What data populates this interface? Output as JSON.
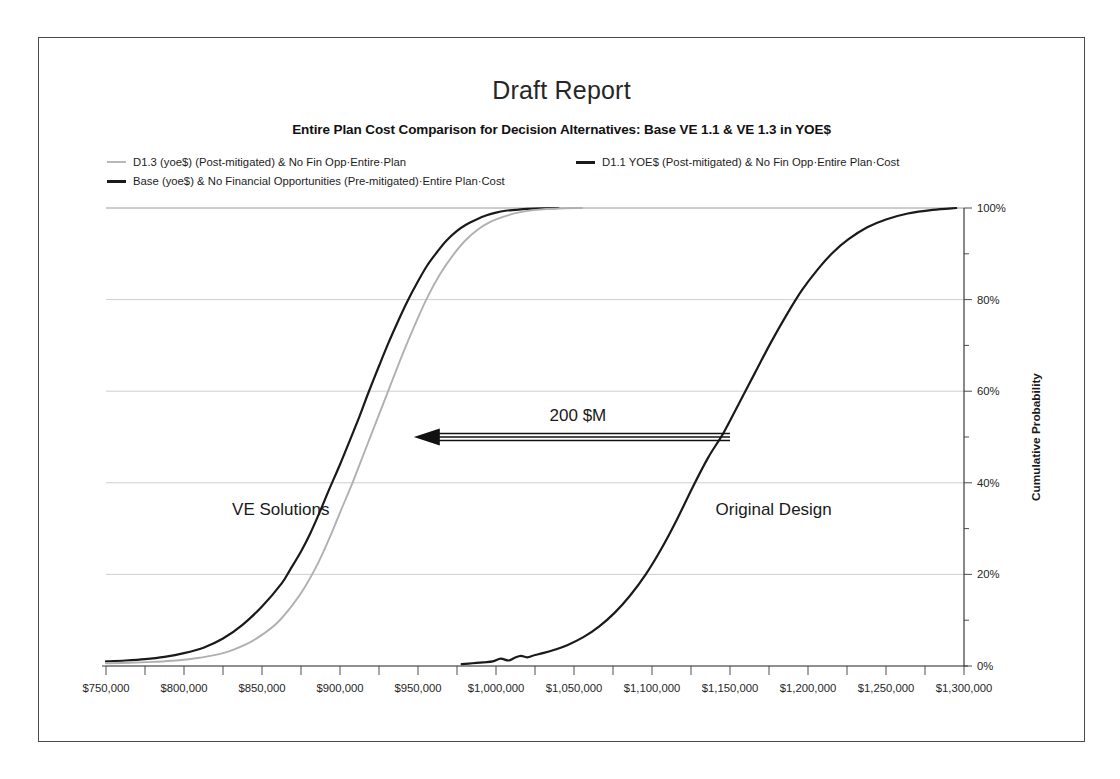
{
  "title": "Draft Report",
  "subtitle": "Entire Plan Cost Comparison for Decision Alternatives: Base VE 1.1 & VE 1.3 in YOE$",
  "legend": [
    {
      "label": "D1.3 (yoe$) (Post-mitigated) & No Fin Opp·Entire·Plan",
      "color": "#b8b8b8"
    },
    {
      "label": "Base (yoe$) & No Financial Opportunities (Pre-mitigated)·Entire Plan·Cost",
      "color": "#1a1a1a"
    },
    {
      "label": "D1.1 YOE$ (Post-mitigated) & No Fin Opp·Entire Plan·Cost",
      "color": "#1a1a1a"
    }
  ],
  "annotations": {
    "delta_label": "200 $M",
    "left_zone": "VE Solutions",
    "right_zone": "Original Design"
  },
  "chart_data": {
    "type": "line",
    "title": "Entire Plan Cost Comparison for Decision Alternatives: Base VE 1.1 & VE 1.3 in YOE$",
    "subtitle": "Draft Report",
    "xlabel": "",
    "ylabel": "Cumulative Probability",
    "xlim": [
      750000,
      1300000
    ],
    "ylim": [
      0,
      100
    ],
    "grid": true,
    "legend_position": "top",
    "xticks": [
      "$750,000",
      "$800,000",
      "$850,000",
      "$900,000",
      "$950,000",
      "$1,000,000",
      "$1,050,000",
      "$1,100,000",
      "$1,150,000",
      "$1,200,000",
      "$1,250,000",
      "$1,300,000"
    ],
    "xtick_values": [
      750000,
      800000,
      850000,
      900000,
      950000,
      1000000,
      1050000,
      1100000,
      1150000,
      1200000,
      1250000,
      1300000
    ],
    "xtick_minor_step": 25000,
    "yticks": [
      "0%",
      "20%",
      "40%",
      "60%",
      "80%",
      "100%"
    ],
    "ytick_values": [
      0,
      20,
      40,
      60,
      80,
      100
    ],
    "ytick_minor_step": 10,
    "yaxis_side": "right",
    "annotation_delta": "200 $M",
    "annotation_delta_value_x": [
      1150000,
      955000
    ],
    "annotation_delta_value_y": 50,
    "series": [
      {
        "name": "Base (yoe$) & No Financial Opportunities (Pre-mitigated)·Entire Plan·Cost",
        "color": "#1a1a1a",
        "width": 2.2,
        "x": [
          750000,
          762500,
          775000,
          787500,
          800000,
          812500,
          825000,
          837500,
          850000,
          862500,
          868000,
          875000,
          881000,
          887500,
          893000,
          900000,
          906000,
          912500,
          918000,
          925000,
          931000,
          937500,
          943000,
          950000,
          956000,
          962500,
          968000,
          975000,
          981000,
          987500,
          994000,
          1000000,
          1006000,
          1012500,
          1020000,
          1030000,
          1040000
        ],
        "y": [
          1.0,
          1.2,
          1.5,
          2.0,
          2.8,
          4.0,
          6.0,
          9.0,
          13.0,
          18.0,
          21.0,
          25.0,
          29.0,
          34.0,
          38.5,
          44.0,
          49.0,
          54.5,
          59.5,
          65.5,
          70.5,
          75.5,
          79.5,
          84.0,
          87.5,
          90.5,
          92.8,
          95.0,
          96.4,
          97.5,
          98.4,
          99.0,
          99.4,
          99.6,
          99.8,
          99.95,
          100.0
        ]
      },
      {
        "name": "D1.3 (yoe$) (Post-mitigated) & No Fin Opp·Entire·Plan",
        "color": "#b0b0b0",
        "width": 1.9,
        "x": [
          750000,
          765000,
          780000,
          795000,
          810000,
          825000,
          840000,
          850000,
          860000,
          870000,
          878000,
          886000,
          894000,
          900000,
          908000,
          916000,
          924000,
          932000,
          940000,
          948000,
          956000,
          964000,
          972000,
          980000,
          988000,
          996000,
          1004000,
          1014000,
          1026000,
          1040000,
          1055000
        ],
        "y": [
          0.6,
          0.7,
          0.9,
          1.2,
          1.8,
          2.8,
          4.8,
          6.8,
          9.5,
          13.5,
          17.5,
          22.5,
          28.5,
          33.5,
          40.0,
          47.0,
          54.0,
          61.0,
          68.0,
          74.5,
          80.5,
          85.5,
          89.5,
          92.8,
          95.2,
          96.9,
          98.0,
          99.0,
          99.6,
          99.9,
          100.0
        ]
      },
      {
        "name": "D1.1 YOE$ (Post-mitigated) & No Fin Opp·Entire Plan·Cost",
        "color": "#1a1a1a",
        "width": 2.2,
        "x": [
          978000,
          985000,
          992000,
          998000,
          1003000,
          1008000,
          1012000,
          1016000,
          1020000,
          1025000,
          1030000,
          1038000,
          1046000,
          1056000,
          1066000,
          1076000,
          1086000,
          1096000,
          1106000,
          1116000,
          1126000,
          1136000,
          1146000,
          1156000,
          1166000,
          1176000,
          1186000,
          1196000,
          1206000,
          1216000,
          1226000,
          1238000,
          1250000,
          1264000,
          1280000,
          1295000
        ],
        "y": [
          0.4,
          0.6,
          0.8,
          1.0,
          1.6,
          1.2,
          1.8,
          2.2,
          1.9,
          2.4,
          2.8,
          3.6,
          4.6,
          6.3,
          8.6,
          11.6,
          15.4,
          20.0,
          25.6,
          32.0,
          39.0,
          45.5,
          51.0,
          57.5,
          64.0,
          70.5,
          76.5,
          82.0,
          86.5,
          90.3,
          93.2,
          95.8,
          97.5,
          98.8,
          99.6,
          100.0
        ]
      }
    ]
  }
}
